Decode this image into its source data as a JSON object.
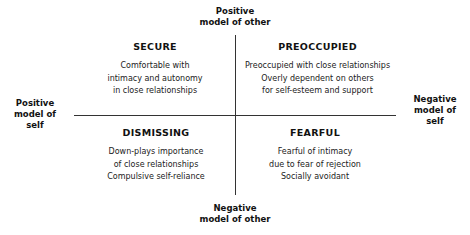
{
  "axes": {
    "top": [
      "Positive",
      "model of other"
    ],
    "bottom": [
      "Negative",
      "model of other"
    ],
    "left": [
      "Positive",
      "model of",
      "self"
    ],
    "right": [
      "Negative",
      "model of",
      "self"
    ]
  },
  "quadrants": {
    "secure": {
      "title": "SECURE",
      "lines": [
        "Comfortable with",
        "intimacy and autonomy",
        "in close relationships"
      ]
    },
    "preoccupied": {
      "title": "PREOCCUPIED",
      "lines": [
        "Preoccupied with close relationships",
        "Overly dependent on others",
        "for self-esteem and support"
      ]
    },
    "dismissing": {
      "title": "DISMISSING",
      "lines": [
        "Down-plays importance",
        "of close relationships",
        "Compulsive self-reliance"
      ]
    },
    "fearful": {
      "title": "FEARFUL",
      "lines": [
        "Fearful of intimacy",
        "due to fear of rejection",
        "Socially avoidant"
      ]
    }
  }
}
